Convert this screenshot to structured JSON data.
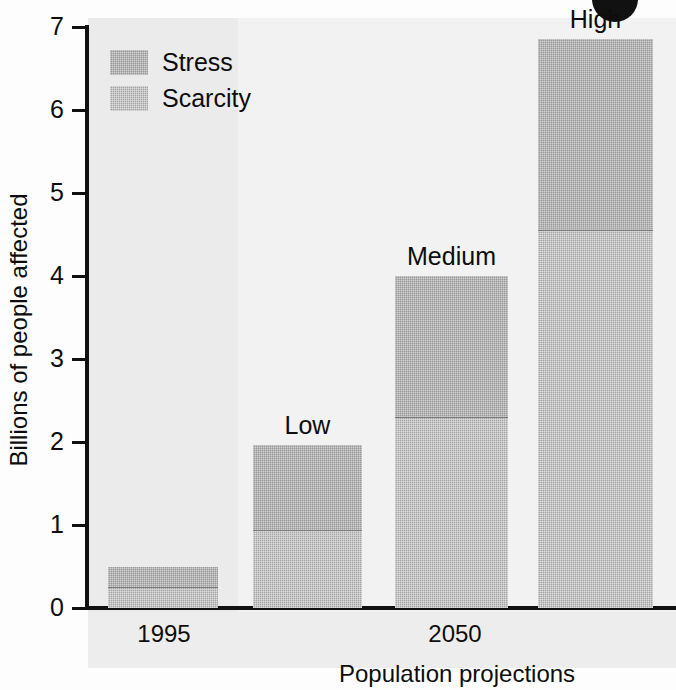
{
  "chart_data": {
    "type": "bar",
    "title": "",
    "subtitle": "",
    "xlabel": "Population projections",
    "ylabel": "Billions of people affected",
    "ylim": [
      0,
      7
    ],
    "yticks": [
      "0",
      "1",
      "2",
      "3",
      "4",
      "5",
      "6",
      "7"
    ],
    "grid": false,
    "stacked": true,
    "legend_position": "top-left",
    "categories": [
      "1995",
      "Low",
      "Medium",
      "High"
    ],
    "group_labels": [
      "1995",
      "2050"
    ],
    "series": [
      {
        "name": "Scarcity",
        "values": [
          0.25,
          0.94,
          2.3,
          4.55
        ]
      },
      {
        "name": "Stress",
        "values": [
          0.25,
          1.03,
          1.7,
          2.3
        ]
      }
    ],
    "totals": [
      0.5,
      1.97,
      4.0,
      6.85
    ]
  },
  "legend": {
    "items": [
      {
        "label": "Stress",
        "color": "#9a9a9a"
      },
      {
        "label": "Scarcity",
        "color": "#a4a4a4"
      }
    ]
  },
  "bars": [
    {
      "label": "1995",
      "show_label": false,
      "scarcity": 0.25,
      "stress": 0.25,
      "total": 0.5
    },
    {
      "label": "Low",
      "show_label": true,
      "scarcity": 0.94,
      "stress": 1.03,
      "total": 1.97
    },
    {
      "label": "Medium",
      "show_label": true,
      "scarcity": 2.3,
      "stress": 1.7,
      "total": 4.0
    },
    {
      "label": "High",
      "show_label": true,
      "scarcity": 4.55,
      "stress": 2.3,
      "total": 6.85
    }
  ],
  "axes": {
    "y_title": "Billions of people affected",
    "x_title": "Population projections",
    "y_tick_labels": [
      "7",
      "6",
      "5",
      "4",
      "3",
      "2",
      "1",
      "0"
    ],
    "group_label_left": "1995",
    "group_label_right": "2050"
  },
  "colors": {
    "stress": "#9a9a9a",
    "scarcity": "#a4a4a4",
    "axis": "#111111",
    "panel_left": "#ebebeb",
    "panel_right": "#f2f2f2",
    "text": "#0d0d0d"
  }
}
